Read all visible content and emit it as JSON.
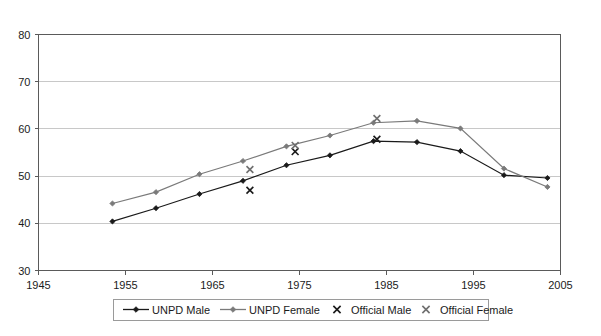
{
  "chart_data": {
    "type": "line",
    "title": "",
    "subtitle": "",
    "xlabel": "",
    "ylabel": "",
    "xlim": [
      1945,
      2005
    ],
    "ylim": [
      30,
      80
    ],
    "xticks": [
      1945,
      1955,
      1965,
      1975,
      1985,
      1995,
      2005
    ],
    "yticks": [
      30,
      40,
      50,
      60,
      70,
      80
    ],
    "grid": "horizontal",
    "legend_position": "bottom",
    "series": [
      {
        "name": "UNPD Male",
        "type": "line",
        "marker": "diamond",
        "color": "#1a1a1a",
        "x": [
          1953.5,
          1958.5,
          1963.5,
          1968.5,
          1973.5,
          1978.5,
          1983.5,
          1988.5,
          1993.5,
          1998.5,
          2003.5
        ],
        "y": [
          40.4,
          43.2,
          46.2,
          49.0,
          52.3,
          54.4,
          57.4,
          57.2,
          55.3,
          50.2,
          49.6
        ]
      },
      {
        "name": "UNPD Female",
        "type": "line",
        "marker": "diamond",
        "color": "#7a7a7a",
        "x": [
          1953.5,
          1958.5,
          1963.5,
          1968.5,
          1973.5,
          1978.5,
          1983.5,
          1988.5,
          1993.5,
          1998.5,
          2003.5
        ],
        "y": [
          44.2,
          46.6,
          50.4,
          53.2,
          56.3,
          58.6,
          61.3,
          61.7,
          60.1,
          51.6,
          47.7
        ]
      },
      {
        "name": "Official Male",
        "type": "scatter",
        "marker": "x",
        "color": "#1a1a1a",
        "x": [
          1969.3,
          1974.5,
          1983.9
        ],
        "y": [
          47.0,
          55.2,
          57.8
        ]
      },
      {
        "name": "Official Female",
        "type": "scatter",
        "marker": "x",
        "color": "#6f6f6f",
        "x": [
          1969.3,
          1974.5,
          1983.9
        ],
        "y": [
          51.4,
          56.5,
          62.2
        ]
      }
    ],
    "legend_entries": [
      {
        "label": "UNPD Male",
        "marker": "line-diamond",
        "color": "#1a1a1a"
      },
      {
        "label": "UNPD Female",
        "marker": "line-diamond",
        "color": "#7a7a7a"
      },
      {
        "label": "Official Male",
        "marker": "x",
        "color": "#1a1a1a"
      },
      {
        "label": "Official Female",
        "marker": "x",
        "color": "#6f6f6f"
      }
    ]
  },
  "axis": {
    "y_tick_labels": [
      "80",
      "70",
      "60",
      "50",
      "40",
      "30"
    ],
    "x_tick_labels": [
      "1945",
      "1955",
      "1965",
      "1975",
      "1985",
      "1995",
      "2005"
    ]
  },
  "legend": {
    "items": [
      {
        "label": "UNPD Male"
      },
      {
        "label": "UNPD Female"
      },
      {
        "label": "Official Male"
      },
      {
        "label": "Official Female"
      }
    ]
  }
}
